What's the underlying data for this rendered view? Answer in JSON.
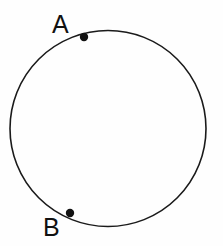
{
  "figure": {
    "background_color": "#fefefe",
    "width": 223,
    "height": 246
  },
  "shapes": {
    "circle": {
      "name": "circle",
      "center_x": 108,
      "center_y": 128.5,
      "radius": 98,
      "stroke_color": "#1a1a1a",
      "stroke_width": 1.6,
      "fill": "none"
    }
  },
  "points": [
    {
      "id": "A",
      "label": "A",
      "marker_x": 84,
      "marker_y": 37,
      "marker_radius": 4.2,
      "marker_color": "#111111",
      "label_x": 52,
      "label_y": 12
    },
    {
      "id": "B",
      "label": "B",
      "marker_x": 70,
      "marker_y": 213,
      "marker_radius": 4.2,
      "marker_color": "#111111",
      "label_x": 43,
      "label_y": 215
    }
  ]
}
